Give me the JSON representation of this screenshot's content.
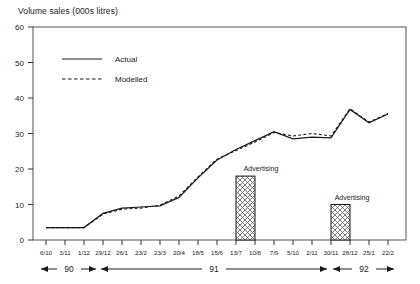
{
  "chart_data": {
    "type": "line",
    "title": "Volume sales (000s litres)",
    "xlabel": "",
    "ylabel": "Volume sales (000s litres)",
    "ylim": [
      0,
      60
    ],
    "yticks": [
      0,
      10,
      20,
      30,
      40,
      50,
      60
    ],
    "grid": false,
    "legend_position": "top-left-inside",
    "categories": [
      "6/10",
      "3/11",
      "1/12",
      "29/12",
      "26/1",
      "23/2",
      "23/3",
      "20/4",
      "18/5",
      "15/6",
      "13/7",
      "10/8",
      "7/9",
      "5/10",
      "2/11",
      "30/11",
      "28/12",
      "25/1",
      "22/2"
    ],
    "series": [
      {
        "name": "Actual",
        "style": "solid",
        "values": [
          3.5,
          3.5,
          3.5,
          7.5,
          9.0,
          9.3,
          9.6,
          12.0,
          17.5,
          22.5,
          25.5,
          28.0,
          30.5,
          28.5,
          29.0,
          28.8,
          36.8,
          33.0,
          35.5
        ]
      },
      {
        "name": "Modelled",
        "style": "dashed",
        "values": [
          3.5,
          3.5,
          3.5,
          7.3,
          8.7,
          9.0,
          9.8,
          12.4,
          17.8,
          22.8,
          25.2,
          27.6,
          30.3,
          29.3,
          30.0,
          29.3,
          37.0,
          33.2,
          35.6
        ]
      }
    ],
    "bars": [
      {
        "label": "Advertising",
        "start_category": "13/7",
        "end_category": "10/8",
        "value": 18
      },
      {
        "label": "Advertising",
        "start_category": "30/11",
        "end_category": "28/12",
        "value": 10
      }
    ],
    "annotations": [
      {
        "text": "Advertising",
        "for_bar": 0
      },
      {
        "text": "Advertising",
        "for_bar": 1
      }
    ],
    "year_spans": [
      {
        "label": "90",
        "from_category": "6/10",
        "to_category": "29/12"
      },
      {
        "label": "91",
        "from_category": "29/12",
        "to_category": "30/11"
      },
      {
        "label": "92",
        "from_category": "30/11",
        "to_category": "22/2"
      }
    ]
  },
  "legend": {
    "actual": "Actual",
    "modelled": "Modelled"
  },
  "axis": {
    "y_title": "Volume sales (000s litres)",
    "y_tick_0": "0",
    "y_tick_10": "10",
    "y_tick_20": "20",
    "y_tick_30": "30",
    "y_tick_40": "40",
    "y_tick_50": "50",
    "y_tick_60": "60"
  },
  "x_labels": {
    "t0": "6/10",
    "t1": "3/11",
    "t2": "1/12",
    "t3": "29/12",
    "t4": "26/1",
    "t5": "23/2",
    "t6": "23/3",
    "t7": "20/4",
    "t8": "18/5",
    "t9": "15/6",
    "t10": "13/7",
    "t11": "10/8",
    "t12": "7/9",
    "t13": "5/10",
    "t14": "2/11",
    "t15": "30/11",
    "t16": "28/12",
    "t17": "25/1",
    "t18": "22/2"
  },
  "bar_labels": {
    "first": "Advertising",
    "second": "Advertising"
  },
  "year_labels": {
    "y90": "90",
    "y91": "91",
    "y92": "92"
  },
  "colors": {
    "line": "#1a1a1a",
    "frame": "#4d4d4d",
    "bar_fill": "#ffffff",
    "bar_stroke": "#1a1a1a",
    "hatch": "#555555"
  }
}
